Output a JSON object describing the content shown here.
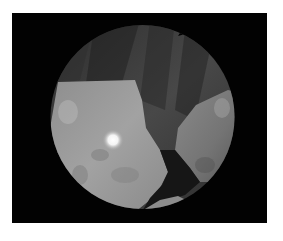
{
  "image": {
    "description": "Grayscale endoscopic view inside a circular field on a black background",
    "background_color": "#ffffff",
    "frame_color": "#020202",
    "regions": {
      "tissue_dark": "#3a3a3a",
      "tissue_mid": "#5a5a5a",
      "tissue_light": "#9a9a9a",
      "tissue_right": "#7c7c7c",
      "shadow": "#141414",
      "highlight": "#ffffff"
    }
  }
}
